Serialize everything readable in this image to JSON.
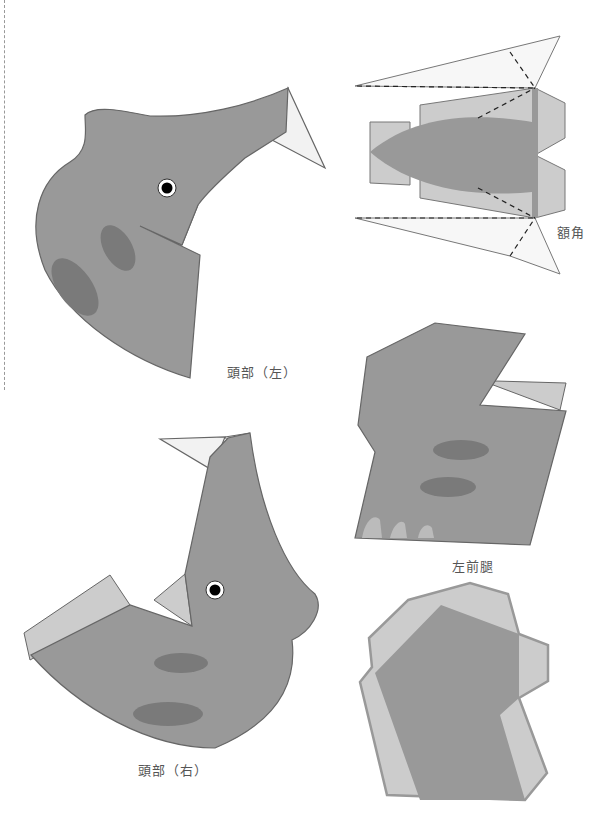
{
  "labels": {
    "head_left": "頭部（左）",
    "frill_horn": "額角",
    "left_front_leg": "左前腿",
    "head_right": "頭部（右）"
  },
  "colors": {
    "body": "#999999",
    "outline": "#666666",
    "spot": "#7a7a7a",
    "flap": "#cccccc",
    "horn": "#f2f2f2",
    "eye": "#000000"
  }
}
